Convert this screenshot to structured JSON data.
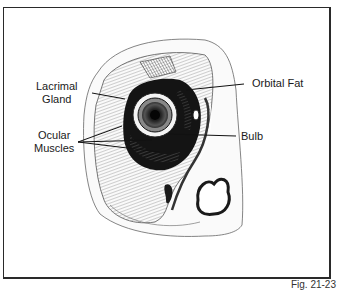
{
  "figure": {
    "caption": "Fig. 21-23",
    "labels": [
      {
        "id": "lacrimal-gland",
        "line1": "Lacrimal",
        "line2": "Gland"
      },
      {
        "id": "ocular-muscles",
        "line1": "Ocular",
        "line2": "Muscles"
      },
      {
        "id": "orbital-fat",
        "line1": "Orbital Fat"
      },
      {
        "id": "bulb",
        "line1": "Bulb"
      }
    ]
  },
  "colors": {
    "frame": "#2a2a2a",
    "ink": "#1a1a1a",
    "background": "#ffffff"
  }
}
